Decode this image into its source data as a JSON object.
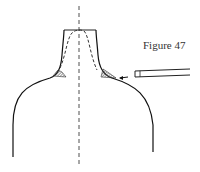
{
  "figure": {
    "label": "Figure 47",
    "colors": {
      "stroke": "#1a1a1a",
      "background": "#ffffff",
      "hatch": "#444444"
    }
  }
}
